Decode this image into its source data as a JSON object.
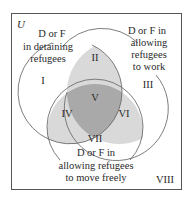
{
  "diagram": {
    "type": "venn",
    "universe_label": "U",
    "sets": [
      {
        "id": "A",
        "label_lines": [
          "D or F",
          "in detaining",
          "refugees"
        ]
      },
      {
        "id": "B",
        "label_lines": [
          "D or F in",
          "allowing",
          "refugees",
          "to work"
        ]
      },
      {
        "id": "C",
        "label_lines": [
          "D or F in",
          "allowing refugees",
          "to move freely"
        ]
      }
    ],
    "regions": {
      "r1": "I",
      "r2": "II",
      "r3": "III",
      "r4": "IV",
      "r5": "V",
      "r6": "VI",
      "r7": "VII",
      "r8": "VIII"
    },
    "colors": {
      "border": "#555555",
      "circle_stroke": "#6e6e6e",
      "light_fill": "#d9d9d9",
      "dark_fill": "#a9a9a9",
      "text": "#2a2a2a"
    }
  }
}
